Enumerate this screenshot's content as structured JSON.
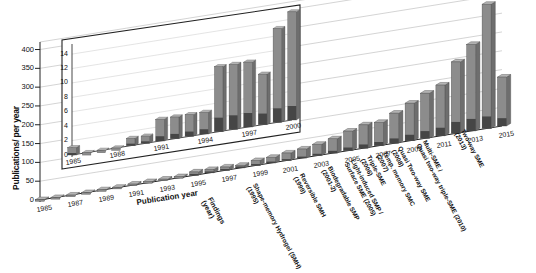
{
  "chart_data": {
    "type": "bar",
    "title": "",
    "subtitle": "",
    "xlabel": "Publication year",
    "ylabel": "Publications/ per year",
    "ylim": [
      0,
      420
    ],
    "yticks": [
      0,
      50,
      100,
      150,
      200,
      250,
      300,
      350,
      400
    ],
    "grid": true,
    "legend_position": "none",
    "projection": "3d-bar",
    "categories": [
      1985,
      1986,
      1987,
      1988,
      1989,
      1990,
      1991,
      1992,
      1993,
      1994,
      1995,
      1996,
      1997,
      1998,
      1999,
      2000,
      2001,
      2002,
      2003,
      2004,
      2005,
      2006,
      2007,
      2008,
      2009,
      2010,
      2011,
      2012,
      2013,
      2014,
      2015
    ],
    "xtick_labels": [
      "1985",
      "1987",
      "1989",
      "1991",
      "1993",
      "1995",
      "1997",
      "1999",
      "2001",
      "2003",
      "2005",
      "2007",
      "2009",
      "2011",
      "2013",
      "2015"
    ],
    "values": [
      1,
      0,
      0,
      0,
      1,
      1,
      3,
      3,
      3,
      3,
      9,
      9,
      9,
      7,
      13,
      15,
      20,
      24,
      30,
      38,
      52,
      62,
      62,
      80,
      100,
      120,
      135,
      190,
      230,
      330,
      390
    ],
    "series": [
      {
        "name": "Publications per year",
        "values": [
          1,
          0,
          0,
          0,
          1,
          1,
          3,
          3,
          3,
          3,
          9,
          9,
          9,
          7,
          13,
          15,
          20,
          24,
          30,
          38,
          52,
          62,
          62,
          80,
          100,
          120,
          135,
          190,
          230,
          330,
          390
        ]
      }
    ],
    "note_2015": "Partial year count (~130)",
    "last_bar_value": 130,
    "annotations": [
      {
        "label": "Findings (year)",
        "type": "axis-title",
        "year": null
      },
      {
        "label": "Shape-memory Hydrogel (SMH) (1995)",
        "year": 1995
      },
      {
        "label": "Reversible SMH (1999)",
        "year": 1999
      },
      {
        "label": "Biodegradable SMP (2001-2)",
        "year": 2002
      },
      {
        "label": "Light-induced SMP / Surface SME (2005)",
        "year": 2005
      },
      {
        "label": "Triple-SME (2006)",
        "year": 2006
      },
      {
        "label": "Temp. memory SMC (2007)",
        "year": 2007
      },
      {
        "label": "Quasi Two-way SME (2008)",
        "year": 2008
      },
      {
        "label": "Multi-SME / Quasi two-way triple-SME (2010)",
        "year": 2010
      },
      {
        "label": "Two-way SME (2013)",
        "year": 2013
      }
    ],
    "inset": {
      "type": "bar",
      "ylim": [
        0,
        15
      ],
      "yticks": [
        0,
        2,
        4,
        6,
        8,
        10,
        12,
        14
      ],
      "grid": true,
      "categories": [
        1985,
        1986,
        1987,
        1988,
        1989,
        1990,
        1991,
        1992,
        1993,
        1994,
        1995,
        1996,
        1997,
        1998,
        1999,
        2000
      ],
      "xtick_labels": [
        "1985",
        "1988",
        "1991",
        "1994",
        "1997",
        "2000"
      ],
      "values": [
        1,
        0,
        0,
        0,
        1,
        1,
        3,
        3,
        3,
        3,
        9,
        9,
        9,
        7,
        13,
        15
      ]
    }
  },
  "colors": {
    "bar_front": "#8c8c8c",
    "bar_side": "#6e6e6e",
    "bar_top": "#b5b5b5",
    "bar_base": "#3a3a3a",
    "grid": "#c9c9c9",
    "axis": "#222222",
    "text": "#111111",
    "background": "#ffffff"
  }
}
